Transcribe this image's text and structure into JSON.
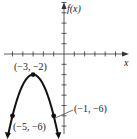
{
  "chart_data": {
    "type": "line",
    "title": "",
    "function": "f(x) = -(x+3)^2 - 2",
    "xlabel": "x",
    "ylabel": "f(x)",
    "xlim": [
      -6,
      5
    ],
    "ylim": [
      -7,
      5
    ],
    "grid": false,
    "series": [
      {
        "name": "parabola",
        "x": [
          -5.4,
          -5,
          -4,
          -3,
          -2,
          -1,
          -0.6
        ],
        "y": [
          -7.76,
          -6,
          -3,
          -2,
          -3,
          -6,
          -7.76
        ]
      }
    ],
    "points": [
      {
        "x": -3,
        "y": -2,
        "label": "(−3, −2)"
      },
      {
        "x": -5,
        "y": -6,
        "label": "(−5, −6)"
      },
      {
        "x": -1,
        "y": -6,
        "label": "(−1, −6)"
      }
    ],
    "annotations": [
      "(−3, −2)",
      "(−5, −6)",
      "(−1, −6)"
    ]
  },
  "labels": {
    "y_axis": "f(x)",
    "x_axis": "x",
    "vertex": "(−3, −2)",
    "left_point": "(−5, −6)",
    "right_point": "(−1, −6)"
  }
}
